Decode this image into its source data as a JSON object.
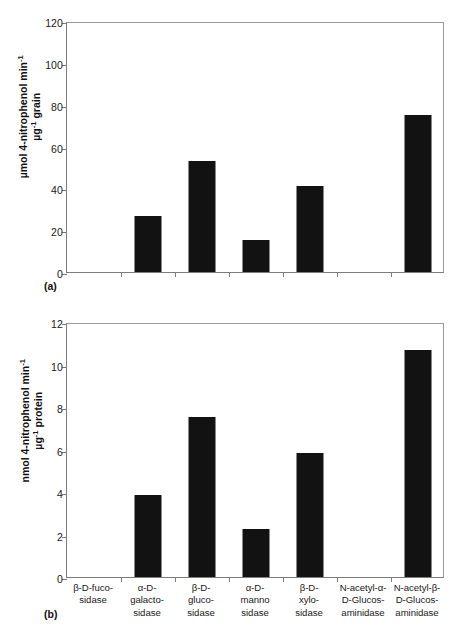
{
  "figure": {
    "panels": [
      {
        "letter": "(a)",
        "ylabel_line1": "µmol 4-nitrophenol min",
        "ylabel_line1_sup": "-1",
        "ylabel_line2": "µg",
        "ylabel_line2_sup": "-1",
        "ylabel_line2_tail": " grain",
        "yticks": [
          "0",
          "20",
          "40",
          "60",
          "80",
          "100",
          "120"
        ]
      },
      {
        "letter": "(b)",
        "ylabel_line1": "nmol 4-nitrophenol min",
        "ylabel_line1_sup": "-1",
        "ylabel_line2": "µg",
        "ylabel_line2_sup": "-1",
        "ylabel_line2_tail": " protein",
        "yticks": [
          "0",
          "2",
          "4",
          "6",
          "8",
          "10",
          "12"
        ]
      }
    ],
    "categories": [
      [
        "β-D-fuco-",
        "sidase"
      ],
      [
        "α-D-",
        "galacto-",
        "sidase"
      ],
      [
        "β-D-",
        "gluco-",
        "sidase"
      ],
      [
        "α-D-",
        "manno",
        "sidase"
      ],
      [
        "β-D-",
        "xylo-",
        "sidase"
      ],
      [
        "N-acetyl-α-",
        "D-Glucos-",
        "aminidase"
      ],
      [
        "N-acetyl-β-",
        "D-Glucos-",
        "aminidase"
      ]
    ]
  },
  "chart_data": [
    {
      "type": "bar",
      "title": "",
      "panel": "(a)",
      "categories": [
        "β-D-fucosidase",
        "α-D-galactosidase",
        "β-D-glucosidase",
        "α-D-mannosidase",
        "β-D-xylosidase",
        "N-acetyl-α-D-Glucosaminidase",
        "N-acetyl-β-D-Glucosaminidase"
      ],
      "values": [
        0,
        27,
        53,
        15.5,
        41,
        0,
        75
      ],
      "xlabel": "",
      "ylabel": "µmol 4-nitrophenol min-1 µg-1 grain",
      "ylim": [
        0,
        120
      ],
      "ytick_step": 20,
      "grid": false,
      "legend": false,
      "bar_color": "#121212"
    },
    {
      "type": "bar",
      "title": "",
      "panel": "(b)",
      "categories": [
        "β-D-fucosidase",
        "α-D-galactosidase",
        "β-D-glucosidase",
        "α-D-mannosidase",
        "β-D-xylosidase",
        "N-acetyl-α-D-Glucosaminidase",
        "N-acetyl-β-D-Glucosaminidase"
      ],
      "values": [
        0,
        3.85,
        7.55,
        2.25,
        5.85,
        0,
        10.7
      ],
      "xlabel": "",
      "ylabel": "nmol 4-nitrophenol min-1 µg-1 protein",
      "ylim": [
        0,
        12
      ],
      "ytick_step": 2,
      "grid": false,
      "legend": false,
      "bar_color": "#121212"
    }
  ]
}
